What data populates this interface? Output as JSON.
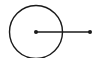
{
  "diagram": {
    "type": "geometry",
    "stroke_color": "#1a1a1a",
    "background": "#ffffff",
    "circle": {
      "cx": 36,
      "cy": 32,
      "r": 26.5,
      "stroke_width": 1.4
    },
    "center_point": {
      "x": 36,
      "y": 32,
      "r": 2
    },
    "segment": {
      "x1": 36,
      "y1": 32,
      "x2": 90,
      "y2": 32,
      "stroke_width": 1.4
    },
    "end_point": {
      "x": 90,
      "y": 32,
      "r": 2
    }
  }
}
